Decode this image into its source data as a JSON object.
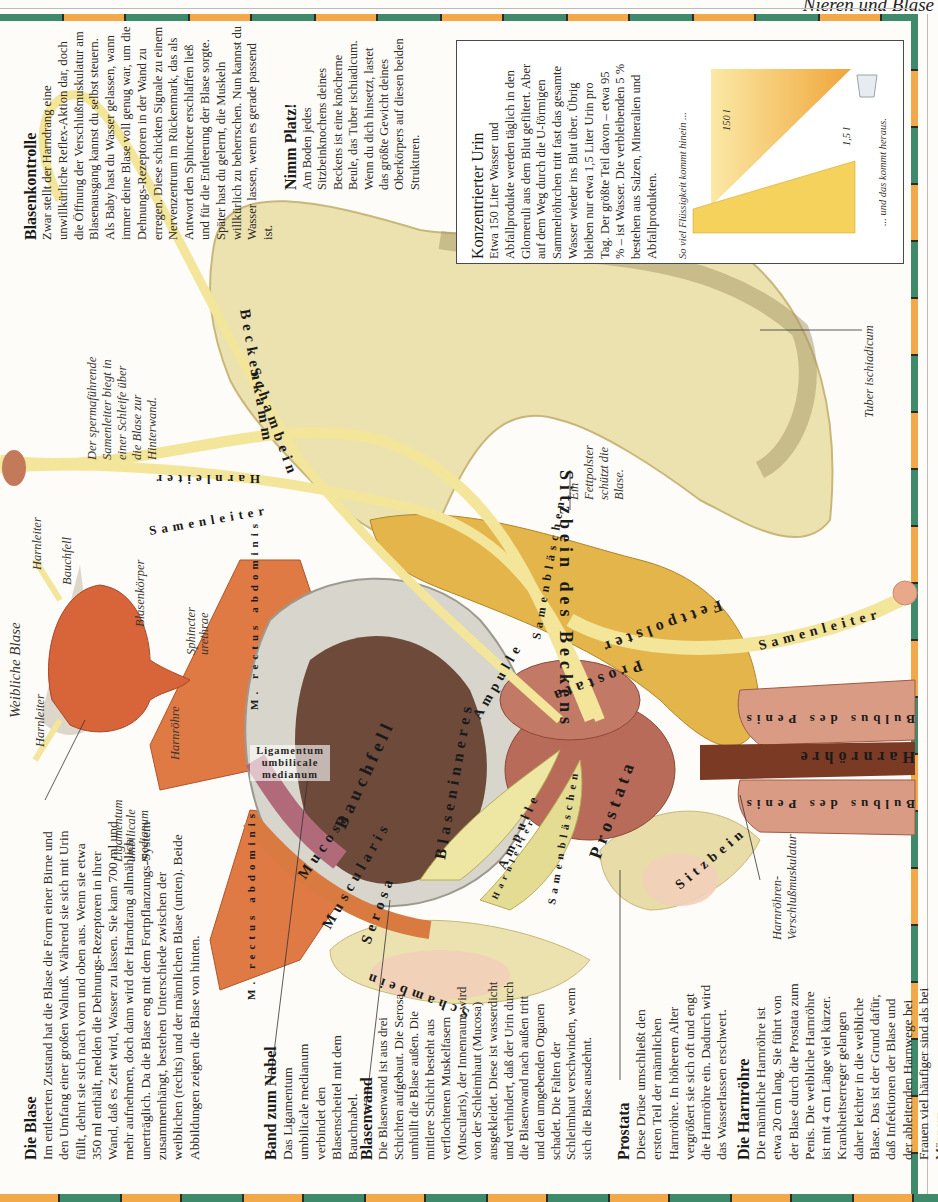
{
  "page": {
    "running_head": "Nieren und Blase"
  },
  "sections": {
    "die_blase": {
      "title": "Die Blase",
      "body": "Im entleerten Zustand hat die Blase die Form einer Birne und den Umfang einer großen Walnuß. Während sie sich mit Urin füllt, dehnt sie sich nach vorn und oben aus. Wenn sie etwa 350 ml enthält, melden die Dehnungs-Rezeptoren in ihrer Wand, daß es Zeit wird, Wasser zu lassen. Sie kann 700 ml und mehr aufnehmen, doch dann wird der Harndrang allmählich unerträglich. Da die Blase eng mit dem Fortpflanzungs-System zusammenhängt, bestehen Unterschiede zwischen der weiblichen (rechts) und der männlichen Blase (unten). Beide Abbildungen zeigen die Blase von hinten."
    },
    "band_zum_nabel": {
      "title": "Band zum Nabel",
      "body": "Das Ligamentum umbilicale medianum verbindet den Blasenscheitel mit dem Bauchnabel."
    },
    "blasenwand": {
      "title": "Blasenwand",
      "body": "Die Blasenwand ist aus drei Schichten aufgebaut. Die Serosa umhüllt die Blase außen. Die mittlere Schicht besteht aus verflochtenen Muskelfasern (Muscularis), der Innenraum wird von der Schleimhaut (Mucosa) ausgekleidet. Diese ist wasserdicht und verhindert, daß der Urin durch die Blasenwand nach außen tritt und den umgebenden Organen schadet. Die Falten der Schleimhaut verschwinden, wenn sich die Blase ausdehnt."
    },
    "prostata": {
      "title": "Prostata",
      "body": "Diese Drüse umschließt den ersten Teil der männlichen Harnröhre. In höherem Alter vergrößert sie sich oft und engt die Harnröhre ein. Dadurch wird das Wasserlassen erschwert."
    },
    "die_harnroehre": {
      "title": "Die Harnröhre",
      "body": "Die männliche Harnröhre ist etwa 20 cm lang. Sie führt von der Blase durch die Prostata zum Penis. Die weibliche Harnröhre ist mit 4 cm Länge viel kürzer. Krankheitserreger gelangen daher leichter in die weibliche Blase. Das ist der Grund dafür, daß Infektionen der Blase und der ableitenden Harnwege bei Frauen viel häufiger sind als bei Männern."
    },
    "blasenkontrolle": {
      "title": "Blasenkontrolle",
      "body": "Zwar stellt der Harndrang eine unwillkürliche Reflex-Aktion dar, doch die Öffnung der Verschlußmuskulatur am Blasenausgang kannst du selbst steuern. Als Baby hast du Wasser gelassen, wann immer deine Blase voll genug war, um die Dehnungs-Rezeptoren in der Wand zu erregen. Diese schickten Signale zu einem Nervenzentrum im Rückenmark, das als Antwort den Sphincter erschlaffen ließ und für die Entleerung der Blase sorgte. Später hast du gelernt, die Muskeln willkürlich zu beherrschen. Nun kannst du Wasser lassen, wenn es gerade passend ist."
    },
    "nimm_platz": {
      "title": "Nimm Platz!",
      "body": "Am Boden jedes Sitzbeinknochens deines Beckens ist eine knöcherne Beule, das Tuber ischiadicum. Wenn du dich hinsetzt, lastet das größte Gewicht deines Oberkörpers auf diesen beiden Strukturen."
    },
    "konzentrierter_urin": {
      "title": "Konzentrierter Urin",
      "body": "Etwa 150 Liter Wasser und Abfallprodukte werden täglich in den Glomeruli aus dem Blut gefiltert. Aber auf dem Weg durch die U-förmigen Sammelröhrchen tritt fast das gesamte Wasser wieder ins Blut über. Übrig bleiben nur etwa 1,5 Liter Urin pro Tag. Der größte Teil davon – etwa 95 % – ist Wasser. Die verbleibenden 5 % bestehen aus Salzen, Mineralien und Abfallprodukten.",
      "caption_in": "So viel Flüssigkeit kommt hinein ...",
      "caption_out": "... und das kommt heraus.",
      "volume_in": "150 l",
      "volume_out": "1,5 l"
    }
  },
  "annotations": {
    "weibliche_blase_title": "Weibliche Blase",
    "harnleiter_1": "Harnleiter",
    "harnleiter_2": "Harnleiter",
    "bauchfell": "Bauchfell",
    "blasenkoerper": "Blasenkörper",
    "sphincter": "Sphincter urethrae",
    "harnroehre": "Harnröhre",
    "ligamentum_small": "Ligamentum umbilicale medianum",
    "samenleiter_note": "Der spermaführende Samenleiter biegt in einer Schleife über die Blase zur Hinterwand.",
    "fettpolster_note": "Ein Fettpolster schützt die Blase.",
    "tuber": "Tuber ischiadicum",
    "harnroehren_verschluss": "Harnröhren-Verschlußmuskulatur",
    "ligamentum_bold": "Ligamentum umbilicale medianum"
  },
  "organ_labels": {
    "sitzbein_des_beckens": "Sitzbein des Beckens",
    "beckenkamm": "Beckenkamm",
    "schambein_top": "Schambein",
    "harnleiter_top": "Harnleiter",
    "samenleiter_left": "Samenleiter",
    "samenleiter_right": "Samenleiter",
    "m_rectus_1": "M. rectus abdominis",
    "m_rectus_2": "M. rectus abdominis",
    "bauchfell": "Bauchfell",
    "blaseninneres": "Blaseninneres",
    "mucosa": "Mucosa",
    "muscularis": "Muscularis",
    "serosa": "Serosa",
    "schambein_bottom": "Schambein",
    "ampulle_1": "Ampulle",
    "ampulle_2": "Ampulle",
    "samenblaeschen_1": "Samenbläschen",
    "samenblaeschen_2": "Samenbläschen",
    "harnleiter_small": "Harnleiter",
    "prostata_1": "Prostata",
    "prostata_2": "Prostata",
    "fettpolster": "Fettpolster",
    "sitzbein": "Sitzbein",
    "bulbus_1": "Bulbus des Penis",
    "bulbus_2": "Bulbus des Penis",
    "harnroehre_big": "Harnröhre"
  },
  "colors": {
    "border_green": "#3f8a6a",
    "border_orange": "#f2a94a",
    "bone": "#ece2b0",
    "muscle": "#e07a45",
    "bladder": "#d8643a",
    "fat": "#e4b54a",
    "prostate": "#b86b58",
    "duct": "#f3e59a"
  }
}
